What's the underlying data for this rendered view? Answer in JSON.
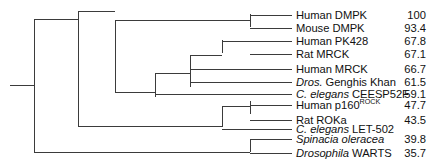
{
  "figure": {
    "kind": "phylogenetic-tree",
    "orientation": "left-to-right-cladogram",
    "line_color": "#3b3b3b",
    "text_color": "#111111",
    "background": "#ffffff"
  },
  "tree": {
    "root_stem_x": 10,
    "root_node_x": 34,
    "leaf_label_x": 296,
    "value_column_right_x": 426,
    "nodes": [
      {
        "id": "root",
        "x": 34,
        "children_y": [
          19,
          152
        ]
      },
      {
        "id": "n-main",
        "x": 78,
        "children_y": [
          11.5,
          126.5
        ]
      },
      {
        "id": "n-dmpk-mrck",
        "x": 115,
        "children_y": [
          20.5,
          92.5
        ]
      },
      {
        "id": "n-dmpk",
        "x": 250,
        "children_y": [
          14,
          27
        ]
      },
      {
        "id": "n-mrck-group",
        "x": 155,
        "children_y": [
          73,
          97
        ]
      },
      {
        "id": "n-mrck-core",
        "x": 190,
        "children_y": [
          55,
          87
        ]
      },
      {
        "id": "n-pk428-ratmrck",
        "x": 222,
        "children_y": [
          40,
          53
        ]
      },
      {
        "id": "n-rock",
        "x": 222,
        "children_y": [
          106,
          127
        ]
      },
      {
        "id": "n-rock-pair",
        "x": 250,
        "children_y": [
          101,
          114
        ]
      },
      {
        "id": "n-outgroup",
        "x": 250,
        "children_y": [
          139,
          152
        ]
      }
    ]
  },
  "leaves": [
    {
      "name": "Human DMPK",
      "name_html": "Human DMPK",
      "value": "100",
      "y": 9,
      "branch_x": 250
    },
    {
      "name": "Mouse DMPK",
      "name_html": "Mouse DMPK",
      "value": "93.4",
      "y": 22,
      "branch_x": 250
    },
    {
      "name": "Human PK428",
      "name_html": "Human PK428",
      "value": "67.8",
      "y": 35,
      "branch_x": 222
    },
    {
      "name": "Rat MRCK",
      "name_html": "Rat MRCK",
      "value": "67.1",
      "y": 48,
      "branch_x": 250
    },
    {
      "name": "Human MRCK",
      "name_html": "Human MRCK",
      "value": "66.7",
      "y": 63,
      "branch_x": 190
    },
    {
      "name": "Dros. Genghis Khan",
      "name_html": "<span class=\"it\">Dros.</span> Genghis Khan",
      "value": "61.5",
      "y": 76,
      "branch_x": 190
    },
    {
      "name": "C. elegans CEESP52F",
      "name_html": "<span class=\"it\">C. elegans</span> CEESP52F",
      "value": "59.1",
      "y": 88,
      "branch_x": 155
    },
    {
      "name": "Human p160ROCK",
      "name_html": "Human p160<span class=\"sup\">ROCK</span>",
      "value": "47.7",
      "y": 99,
      "branch_x": 250
    },
    {
      "name": "Rat ROKa",
      "name_html": "Rat ROKa",
      "value": "43.5",
      "y": 114,
      "branch_x": 250
    },
    {
      "name": "C. elegans LET-502",
      "name_html": "<span class=\"it\">C. elegans</span> LET-502",
      "value": "",
      "y": 123,
      "branch_x": 222
    },
    {
      "name": "Spinacia oleracea",
      "name_html": "<span class=\"it\">Spinacia oleracea</span>",
      "value": "39.8",
      "y": 133,
      "branch_x": 250
    },
    {
      "name": "Drosophila WARTS",
      "name_html": "<span class=\"it\">Drosophila</span> WARTS",
      "value": "35.7",
      "y": 147,
      "branch_x": 250
    }
  ]
}
